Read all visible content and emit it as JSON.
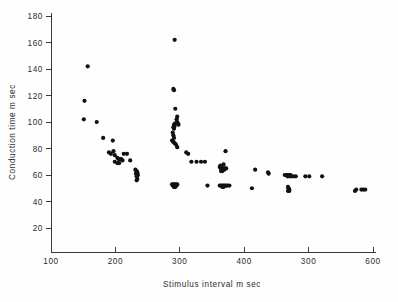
{
  "figure": {
    "background_color": "#fefefe",
    "ink_color": "#111111",
    "axis_color": "#3a3a3a"
  },
  "chart_data": {
    "type": "scatter",
    "title": "",
    "xlabel": "Stimulus  interval   m sec",
    "ylabel": "Conduction time  m sec",
    "xlim": [
      100,
      600
    ],
    "ylim": [
      0,
      180
    ],
    "grid": false,
    "legend": null,
    "xticks": [
      100,
      200,
      300,
      400,
      300,
      600
    ],
    "xtick_values": [
      100,
      200,
      300,
      400,
      500,
      600
    ],
    "yticks": [
      20,
      40,
      60,
      80,
      100,
      120,
      140,
      160,
      180
    ],
    "marker": "filled-circle",
    "marker_size_px": 2.1,
    "series": [
      {
        "name": "conduction time vs stimulus interval",
        "points": [
          [
            157,
            142
          ],
          [
            152,
            116
          ],
          [
            151,
            102
          ],
          [
            171,
            100
          ],
          [
            181,
            88
          ],
          [
            196,
            86
          ],
          [
            190,
            77
          ],
          [
            193,
            76
          ],
          [
            197,
            78
          ],
          [
            199,
            75
          ],
          [
            203,
            73
          ],
          [
            205,
            72
          ],
          [
            207,
            72
          ],
          [
            209,
            72
          ],
          [
            211,
            71
          ],
          [
            199,
            70
          ],
          [
            203,
            69
          ],
          [
            206,
            69
          ],
          [
            213,
            76
          ],
          [
            218,
            76
          ],
          [
            223,
            71
          ],
          [
            231,
            64
          ],
          [
            233,
            63
          ],
          [
            233,
            62
          ],
          [
            234,
            62
          ],
          [
            232,
            61
          ],
          [
            234,
            61
          ],
          [
            235,
            60
          ],
          [
            233,
            59
          ],
          [
            234,
            57
          ],
          [
            233,
            56
          ],
          [
            292,
            162
          ],
          [
            290,
            125
          ],
          [
            291,
            124
          ],
          [
            293,
            110
          ],
          [
            296,
            104
          ],
          [
            295,
            102
          ],
          [
            291,
            98
          ],
          [
            292,
            97
          ],
          [
            293,
            99
          ],
          [
            296,
            100
          ],
          [
            297,
            99
          ],
          [
            298,
            98
          ],
          [
            290,
            96
          ],
          [
            291,
            95
          ],
          [
            289,
            92
          ],
          [
            290,
            90
          ],
          [
            291,
            88
          ],
          [
            288,
            86
          ],
          [
            290,
            85
          ],
          [
            292,
            84
          ],
          [
            294,
            83
          ],
          [
            296,
            81
          ],
          [
            310,
            77
          ],
          [
            313,
            76
          ],
          [
            318,
            70
          ],
          [
            326,
            70
          ],
          [
            333,
            70
          ],
          [
            339,
            70
          ],
          [
            371,
            78
          ],
          [
            362,
            66
          ],
          [
            364,
            65
          ],
          [
            366,
            65
          ],
          [
            368,
            65
          ],
          [
            370,
            65
          ],
          [
            372,
            65
          ],
          [
            367,
            64
          ],
          [
            369,
            64
          ],
          [
            364,
            63
          ],
          [
            366,
            63
          ],
          [
            363,
            67
          ],
          [
            368,
            68
          ],
          [
            417,
            64
          ],
          [
            437,
            62
          ],
          [
            438,
            61
          ],
          [
            463,
            60
          ],
          [
            466,
            60
          ],
          [
            468,
            60
          ],
          [
            470,
            60
          ],
          [
            472,
            60
          ],
          [
            467,
            59
          ],
          [
            470,
            59
          ],
          [
            473,
            59
          ],
          [
            476,
            59
          ],
          [
            480,
            59
          ],
          [
            495,
            59
          ],
          [
            501,
            59
          ],
          [
            521,
            59
          ],
          [
            288,
            53
          ],
          [
            290,
            53
          ],
          [
            292,
            53
          ],
          [
            294,
            53
          ],
          [
            296,
            53
          ],
          [
            289,
            52
          ],
          [
            291,
            52
          ],
          [
            293,
            52
          ],
          [
            295,
            52
          ],
          [
            291,
            51
          ],
          [
            293,
            51
          ],
          [
            343,
            52
          ],
          [
            362,
            52
          ],
          [
            364,
            52
          ],
          [
            366,
            52
          ],
          [
            368,
            52
          ],
          [
            370,
            52
          ],
          [
            372,
            52
          ],
          [
            366,
            51
          ],
          [
            368,
            51
          ],
          [
            374,
            52
          ],
          [
            377,
            52
          ],
          [
            412,
            50
          ],
          [
            468,
            51
          ],
          [
            469,
            50
          ],
          [
            470,
            49
          ],
          [
            468,
            48
          ],
          [
            470,
            48
          ],
          [
            572,
            48
          ],
          [
            574,
            49
          ],
          [
            582,
            49
          ],
          [
            585,
            49
          ],
          [
            588,
            49
          ]
        ]
      }
    ]
  }
}
